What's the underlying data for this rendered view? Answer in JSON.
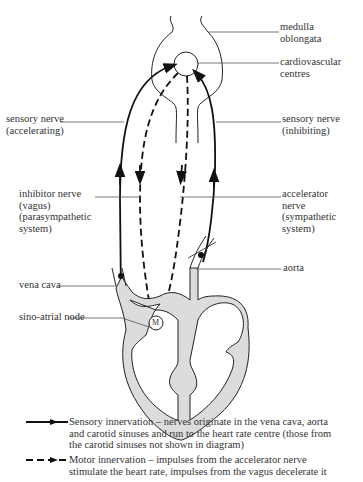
{
  "labels": {
    "medulla": "medulla\noblongata",
    "cardio": "cardiovascular\ncentres",
    "sensory_accel": "sensory nerve\n(accelerating)",
    "sensory_inhib": "sensory nerve\n(inhibiting)",
    "inhibitor": "inhibitor nerve\n(vagus)\n(parasympathetic\nsystem)",
    "accelerator": "accelerator\nnerve\n(sympathetic\nsystem)",
    "vena_cava": "vena cava",
    "aorta": "aorta",
    "sa_node": "sino-atrial node",
    "sa_mark": "M"
  },
  "legend": [
    {
      "line_style": "solid-arrow",
      "text": "Sensory innervation – nerves originate in the vena cava, aorta\nand carotid sinuses and run to the heart rate centre (those from\nthe carotid sinuses not shown in diagram)"
    },
    {
      "line_style": "dashed-arrow",
      "text": "Motor innervation – impulses from the accelerator nerve\nstimulate the heart rate, impulses from the vagus decelerate it"
    }
  ],
  "colors": {
    "line": "#111111",
    "leader": "#555555",
    "heart_fill": "#dcdcdc"
  }
}
